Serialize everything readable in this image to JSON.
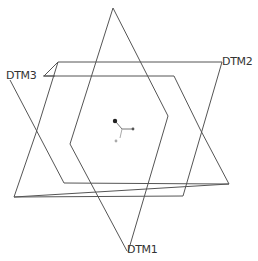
{
  "diagram": {
    "labels": {
      "dtm1": "DTM1",
      "dtm2": "DTM2",
      "dtm3": "DTM3"
    },
    "colors": {
      "line": "#555555",
      "csys_origin": "#333333",
      "csys_axis": "#777777"
    }
  }
}
